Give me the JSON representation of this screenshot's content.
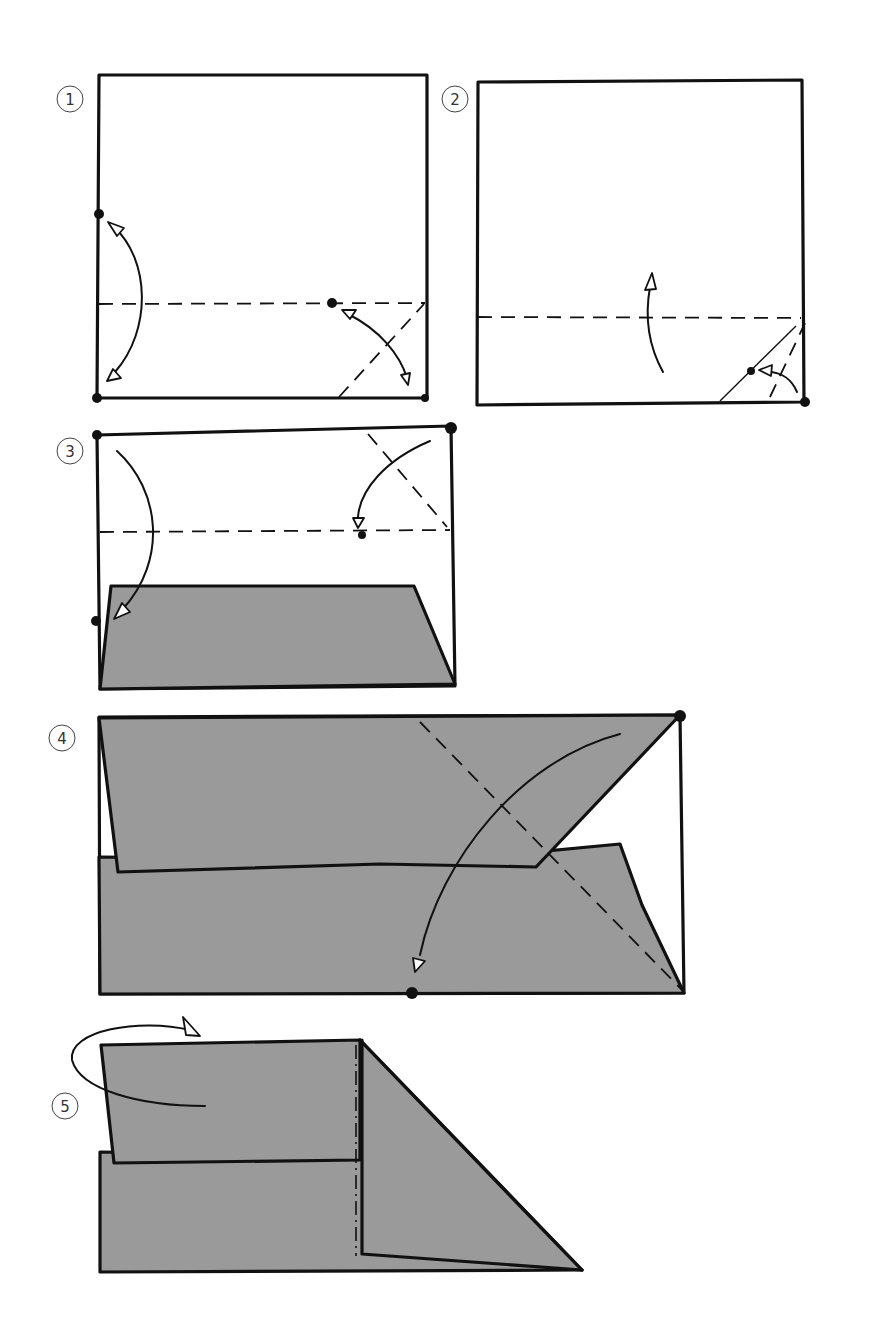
{
  "diagram": {
    "type": "origami-instructions",
    "paper_colors": {
      "front": "#ffffff",
      "back": "#9a9a9a",
      "line": "#111111"
    },
    "steps": [
      {
        "number": "1",
        "label": "step-1",
        "description": "Square paper; valley-fold crease horizontally and a diagonal crease at bottom-right corner, then unfold (two-way arrows)."
      },
      {
        "number": "2",
        "label": "step-2",
        "description": "Fold bottom-right corner to the marked point, then fold bottom edge up along horizontal valley line."
      },
      {
        "number": "3",
        "label": "step-3",
        "description": "Fold top-right corner down to marked point and fold top edge down along horizontal valley line."
      },
      {
        "number": "4",
        "label": "step-4",
        "description": "Fold top-right corner down diagonally to the marked point on bottom edge."
      },
      {
        "number": "5",
        "label": "step-5",
        "description": "Mountain-fold the left portion behind along dash-dot line."
      }
    ],
    "legend": {
      "valley_fold": "dashed line",
      "mountain_fold": "dash-dot line",
      "reference_point": "black dot"
    }
  }
}
